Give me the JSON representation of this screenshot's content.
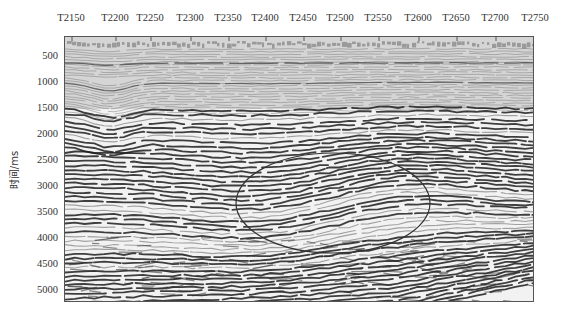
{
  "chart_data": {
    "type": "heatmap",
    "subtype": "seismic-section",
    "title": "",
    "xlabel": "",
    "ylabel": "时间/ms",
    "x_axis_position": "top",
    "x_ticks": [
      "T2150",
      "T2200",
      "T2250",
      "T2300",
      "T2350",
      "T2400",
      "T2450",
      "T2500",
      "T2550",
      "T2600",
      "T2650",
      "T2700",
      "T2750"
    ],
    "y_ticks": [
      500,
      1000,
      1500,
      2000,
      2500,
      3000,
      3500,
      4000,
      4500,
      5000
    ],
    "ylim": [
      5200,
      150
    ],
    "grid": false,
    "legend": null,
    "colormap": "grayscale (black peaks, white troughs)",
    "annotations": [
      {
        "type": "ellipse",
        "description": "highlighted dipping/prograding reflector zone",
        "center_trace": "T2460",
        "center_time_ms": 3350,
        "x_span": [
          "T2265",
          "T2610"
        ],
        "time_span_ms": [
          2450,
          4300
        ],
        "stroke": "#333333"
      }
    ]
  },
  "layout": {
    "plot": {
      "left": 64,
      "top": 36,
      "width": 470,
      "height": 266
    },
    "x_tick_px": [
      71,
      115,
      150,
      190,
      228,
      265,
      303,
      340,
      378,
      418,
      456,
      495,
      535
    ],
    "y_tick_px": [
      55,
      81,
      107,
      133,
      159,
      185,
      211,
      237,
      263,
      289
    ],
    "ellipse": {
      "cx": 268,
      "cy": 166,
      "rx": 97,
      "ry": 50
    }
  },
  "colors": {
    "reflector_dark": "#1e1e1e",
    "reflector_mid": "#6a6a6a",
    "background_light": "#f2f2f2",
    "top_noise": "#9a9a9a",
    "axis": "#555555",
    "text": "#333333"
  }
}
